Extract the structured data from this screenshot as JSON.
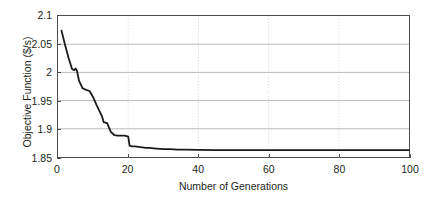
{
  "chart_data": {
    "type": "line",
    "title": "",
    "xlabel": "Number of Generations",
    "ylabel": "Objective Function ($/s)",
    "xlim": [
      0,
      100
    ],
    "ylim": [
      1.85,
      2.1
    ],
    "xticks": [
      "0",
      "20",
      "40",
      "60",
      "80",
      "100"
    ],
    "xtick_values": [
      0,
      20,
      40,
      60,
      80,
      100
    ],
    "yticks": [
      "1.85",
      "1.9",
      "1.95",
      "2",
      "2.05",
      "2.1"
    ],
    "ytick_values": [
      1.85,
      1.9,
      1.95,
      2.0,
      2.05,
      2.1
    ],
    "grid": "horizontal solid gray, vertical dotted light gray",
    "legend": "none",
    "series": [
      {
        "name": "Objective Function",
        "color": "#1a1a1a",
        "line_width": 1.8,
        "x": [
          1,
          2,
          3,
          4,
          4.6,
          5,
          5.4,
          6,
          7,
          8,
          9,
          10,
          11,
          12,
          12.6,
          13,
          13.5,
          14,
          15,
          16,
          17,
          18,
          19,
          19.5,
          20,
          20.4,
          21,
          22,
          23,
          24,
          25,
          26,
          28,
          30,
          32,
          34,
          36,
          40,
          45,
          50,
          60,
          70,
          80,
          90,
          100
        ],
        "values": [
          2.074,
          2.049,
          2.026,
          2.006,
          2.004,
          2.007,
          2.003,
          1.985,
          1.972,
          1.969,
          1.967,
          1.956,
          1.942,
          1.929,
          1.921,
          1.912,
          1.911,
          1.91,
          1.895,
          1.889,
          1.888,
          1.888,
          1.888,
          1.887,
          1.886,
          1.87,
          1.869,
          1.869,
          1.868,
          1.867,
          1.866,
          1.866,
          1.865,
          1.864,
          1.864,
          1.863,
          1.863,
          1.8625,
          1.8623,
          1.8622,
          1.8621,
          1.862,
          1.862,
          1.862,
          1.862
        ]
      }
    ]
  }
}
